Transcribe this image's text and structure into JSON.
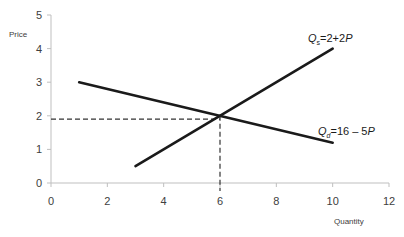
{
  "chart_data": {
    "type": "line",
    "title": "",
    "xlabel": "Quantity",
    "ylabel": "Price",
    "xlim": [
      0,
      12
    ],
    "ylim": [
      0,
      5
    ],
    "x_ticks": [
      0,
      2,
      4,
      6,
      8,
      10,
      12
    ],
    "y_ticks": [
      0,
      1,
      2,
      3,
      4,
      5
    ],
    "grid": false,
    "series": [
      {
        "name": "Supply",
        "label_main": "Q",
        "label_sub": "s",
        "label_rest": "=2+2",
        "label_var": "P",
        "points": [
          [
            3,
            0.5
          ],
          [
            10,
            4.0
          ]
        ],
        "color": "#1a1a1a"
      },
      {
        "name": "Demand",
        "label_main": "Q",
        "label_sub": "d",
        "label_rest": "=16 – 5",
        "label_var": "P",
        "points": [
          [
            1,
            3.0
          ],
          [
            10,
            1.2
          ]
        ],
        "color": "#1a1a1a"
      }
    ],
    "equilibrium": {
      "quantity": 6,
      "price": 1.9
    },
    "annotations": [
      {
        "type": "dashed-hline",
        "y": 1.9,
        "x_from": 0,
        "x_to": 6
      },
      {
        "type": "dashed-vline",
        "x": 6,
        "y_from": 0,
        "y_to": 2
      }
    ]
  }
}
